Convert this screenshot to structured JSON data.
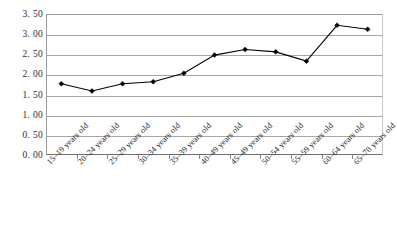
{
  "chart_data": {
    "type": "line",
    "title": "",
    "xlabel": "",
    "ylabel": "",
    "categories": [
      "15–19 years old",
      "20–24 years old",
      "25–29 years old",
      "30–34 years old",
      "35–39 years old",
      "40–49 years old",
      "45–49 years old",
      "50–54 years old",
      "55–59 years old",
      "60–64 years old",
      "65–70 years old"
    ],
    "values": [
      1.77,
      1.59,
      1.77,
      1.82,
      2.03,
      2.48,
      2.62,
      2.56,
      2.33,
      3.22,
      3.12
    ],
    "ylim": [
      0.0,
      3.5
    ],
    "ytick_labels": [
      "0. 00",
      "0. 50",
      "1. 00",
      "1. 50",
      "2. 00",
      "2. 50",
      "3. 00",
      "3. 50"
    ],
    "ytick_values": [
      0.0,
      0.5,
      1.0,
      1.5,
      2.0,
      2.5,
      3.0,
      3.5
    ],
    "grid": true,
    "legend": "none",
    "series_color": "#000000",
    "grid_color": "#a6a6a6",
    "marker": "diamond"
  }
}
